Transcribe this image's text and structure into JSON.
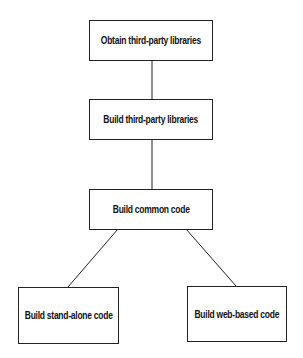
{
  "diagram": {
    "type": "flowchart",
    "nodes": [
      {
        "id": "n1",
        "label": "Obtain third-party libraries"
      },
      {
        "id": "n2",
        "label": "Build third-party libraries"
      },
      {
        "id": "n3",
        "label": "Build common code"
      },
      {
        "id": "n4",
        "label": "Build stand-alone code"
      },
      {
        "id": "n5",
        "label": "Build web-based code"
      }
    ],
    "edges": [
      {
        "from": "n1",
        "to": "n2"
      },
      {
        "from": "n2",
        "to": "n3"
      },
      {
        "from": "n3",
        "to": "n4"
      },
      {
        "from": "n3",
        "to": "n5"
      }
    ],
    "colors": {
      "border": "#222222",
      "background": "#ffffff",
      "text": "#111111"
    }
  }
}
